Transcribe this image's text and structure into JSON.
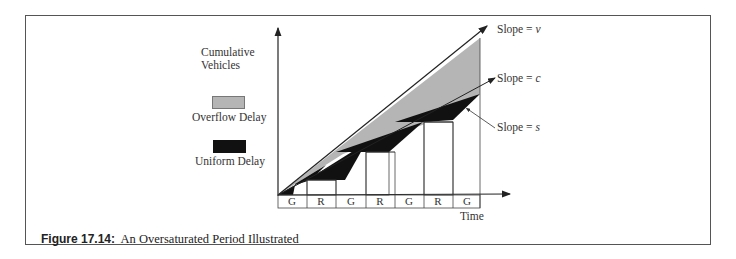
{
  "figure": {
    "caption_number": "Figure 17.14:",
    "caption_text": "An Oversaturated Period Illustrated"
  },
  "axes": {
    "y_label_line1": "Cumulative",
    "y_label_line2": "Vehicles",
    "x_label": "Time"
  },
  "legend": [
    {
      "label": "Overflow Delay",
      "color": "#b5b5b5"
    },
    {
      "label": "Uniform Delay",
      "color": "#111111"
    }
  ],
  "annotations": {
    "slope_v": {
      "prefix": "Slope = ",
      "var": "v"
    },
    "slope_c": {
      "prefix": "Slope = ",
      "var": "c"
    },
    "slope_s": {
      "prefix": "Slope = ",
      "var": "s"
    }
  },
  "signal_phases": [
    "G",
    "R",
    "G",
    "R",
    "G",
    "R",
    "G"
  ],
  "colors": {
    "overflow": "#b5b5b5",
    "uniform": "#111111",
    "line": "#222222"
  }
}
